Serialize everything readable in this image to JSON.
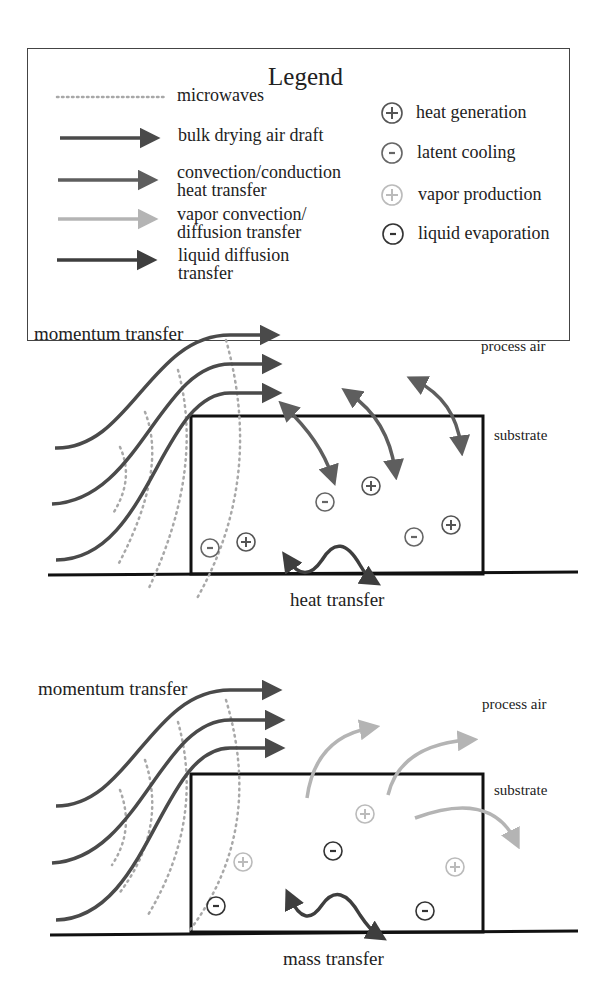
{
  "legend": {
    "title": "Legend",
    "line_items": [
      {
        "label": "microwaves",
        "style": "dotted",
        "color": "#a8a8a8"
      },
      {
        "label": "bulk drying air draft",
        "style": "arrow",
        "color": "#4a4a4a"
      },
      {
        "label": "convection/conduction\nheat transfer",
        "style": "arrow",
        "color": "#5e5e5e"
      },
      {
        "label": "vapor convection/\ndiffusion transfer",
        "style": "arrow",
        "color": "#b4b4b4"
      },
      {
        "label": "liquid diffusion\ntransfer",
        "style": "arrow",
        "color": "#3e3e3e"
      }
    ],
    "symbol_items": [
      {
        "label": "heat generation",
        "symbol": "+",
        "color": "#555555"
      },
      {
        "label": "latent cooling",
        "symbol": "-",
        "color": "#666666"
      },
      {
        "label": "vapor production",
        "symbol": "+",
        "color": "#b8b8b8"
      },
      {
        "label": "liquid evaporation",
        "symbol": "-",
        "color": "#333333"
      }
    ]
  },
  "panels": [
    {
      "id": "heat",
      "momentum_label": "momentum transfer",
      "process_air_label": "process air",
      "substrate_label": "substrate",
      "caption": "heat transfer"
    },
    {
      "id": "mass",
      "momentum_label": "momentum transfer",
      "process_air_label": "process air",
      "substrate_label": "substrate",
      "caption": "mass transfer"
    }
  ],
  "colors": {
    "bulk_air": "#4a4a4a",
    "heat_arrow": "#5e5e5e",
    "vapor_arrow": "#b4b4b4",
    "liquid_arrow": "#3e3e3e",
    "microwave": "#a8a8a8"
  }
}
